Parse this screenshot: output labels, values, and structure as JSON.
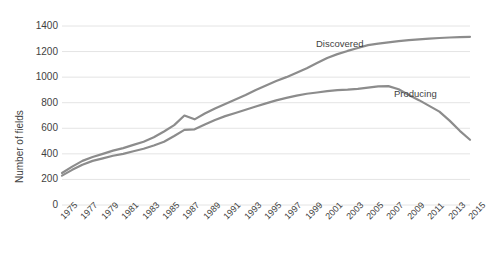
{
  "chart_data": {
    "type": "line",
    "title": "",
    "xlabel": "",
    "ylabel": "Number of fields",
    "ylim": [
      0,
      1400
    ],
    "ytick_values": [
      0,
      200,
      400,
      600,
      800,
      1000,
      1200,
      1400
    ],
    "ytick_labels": [
      "0",
      "200",
      "400",
      "600",
      "800",
      "1000",
      "1200",
      "1400"
    ],
    "xlim": [
      1975,
      2015
    ],
    "x": [
      1975,
      1976,
      1977,
      1978,
      1979,
      1980,
      1981,
      1982,
      1983,
      1984,
      1985,
      1986,
      1987,
      1988,
      1989,
      1990,
      1991,
      1992,
      1993,
      1994,
      1995,
      1996,
      1997,
      1998,
      1999,
      2000,
      2001,
      2002,
      2003,
      2004,
      2005,
      2006,
      2007,
      2008,
      2009,
      2010,
      2011,
      2012,
      2013,
      2014,
      2015
    ],
    "xtick_labels": [
      "1975",
      "1977",
      "1979",
      "1981",
      "1983",
      "1985",
      "1987",
      "1989",
      "1991",
      "1993",
      "1995",
      "1997",
      "1999",
      "2001",
      "2003",
      "2005",
      "2007",
      "2009",
      "2011",
      "2013",
      "2015"
    ],
    "grid": true,
    "grid_axis": "y",
    "legend": "inline-annotation",
    "line_color": "#8c8c8c",
    "series": [
      {
        "name": "Discovered",
        "color": "#8c8c8c",
        "values": [
          250,
          300,
          345,
          375,
          400,
          425,
          445,
          470,
          495,
          530,
          575,
          625,
          700,
          670,
          715,
          755,
          790,
          825,
          860,
          900,
          935,
          970,
          1000,
          1035,
          1070,
          1110,
          1150,
          1180,
          1205,
          1228,
          1250,
          1262,
          1272,
          1282,
          1290,
          1296,
          1301,
          1306,
          1310,
          1313,
          1315
        ]
      },
      {
        "name": "Producing",
        "color": "#8c8c8c",
        "values": [
          230,
          275,
          315,
          345,
          365,
          385,
          400,
          420,
          440,
          465,
          495,
          540,
          588,
          592,
          630,
          665,
          695,
          720,
          745,
          770,
          795,
          818,
          838,
          855,
          870,
          880,
          890,
          898,
          902,
          908,
          918,
          928,
          930,
          905,
          860,
          820,
          775,
          730,
          660,
          580,
          510
        ]
      }
    ],
    "annotations": [
      {
        "text": "Discovered",
        "x": 2003,
        "y": 1290
      },
      {
        "text": "Producing",
        "x": 2009,
        "y": 985
      }
    ]
  },
  "axis": {
    "y_title": "Number of fields"
  }
}
